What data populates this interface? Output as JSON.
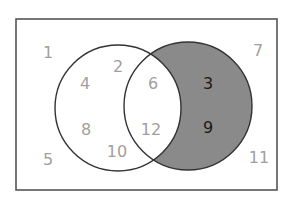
{
  "diagram": {
    "type": "venn",
    "colors": {
      "frame": "#555555",
      "outline": "#333333",
      "shade": "#8a8a8a",
      "muted_text": "#a0a0a0",
      "dark_text": "#1a1a1a",
      "background": "#ffffff"
    },
    "universal": {
      "label": "universal-set",
      "outside": [
        {
          "value": "1",
          "x": 48,
          "y": 58
        },
        {
          "value": "5",
          "x": 48,
          "y": 165
        },
        {
          "value": "7",
          "x": 258,
          "y": 56
        },
        {
          "value": "11",
          "x": 259,
          "y": 163
        }
      ]
    },
    "set_a": {
      "label": "set-a-left",
      "only": [
        {
          "value": "2",
          "x": 118,
          "y": 72
        },
        {
          "value": "4",
          "x": 85,
          "y": 89
        },
        {
          "value": "8",
          "x": 86,
          "y": 135
        },
        {
          "value": "10",
          "x": 117,
          "y": 157
        }
      ]
    },
    "intersection": {
      "label": "a-and-b",
      "items": [
        {
          "value": "6",
          "x": 153,
          "y": 89
        },
        {
          "value": "12",
          "x": 151,
          "y": 135
        }
      ]
    },
    "set_b": {
      "label": "set-b-right-shaded",
      "only": [
        {
          "value": "3",
          "x": 208,
          "y": 89
        },
        {
          "value": "9",
          "x": 208,
          "y": 133
        }
      ]
    }
  }
}
